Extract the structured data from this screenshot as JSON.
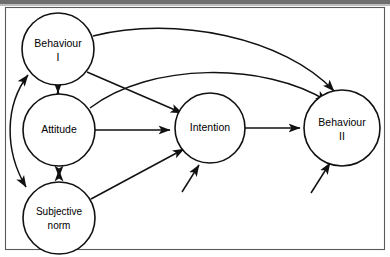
{
  "figure": {
    "kind": "path-diagram",
    "background_color": "#ffffff",
    "line_color": "#111111",
    "frame_color": "#5a5a5a",
    "top_bar_color": "#6e6e6e"
  },
  "nodes": [
    {
      "id": "behaviour1",
      "label_line1": "Behaviour",
      "label_line2": "I",
      "cx": 58,
      "cy": 49,
      "r": 36
    },
    {
      "id": "attitude",
      "label_line1": "Attitude",
      "label_line2": "",
      "cx": 59,
      "cy": 130,
      "r": 36
    },
    {
      "id": "subjective",
      "label_line1": "Subjective",
      "label_line2": "norm",
      "cx": 59,
      "cy": 218,
      "r": 36
    },
    {
      "id": "intention",
      "label_line1": "Intention",
      "label_line2": "",
      "cx": 210,
      "cy": 128,
      "r": 35
    },
    {
      "id": "behaviour2",
      "label_line1": "Behaviour",
      "label_line2": "II",
      "cx": 342,
      "cy": 128,
      "r": 38
    }
  ],
  "edges": [
    {
      "id": "behaviour1-to-behaviour2",
      "from": "behaviour1",
      "to": "behaviour2",
      "style": "curved",
      "arrow": "single"
    },
    {
      "id": "attitude-to-behaviour2",
      "from": "attitude",
      "to": "behaviour2",
      "style": "curved",
      "arrow": "single"
    },
    {
      "id": "behaviour1-to-intention",
      "from": "behaviour1",
      "to": "intention",
      "style": "straight",
      "arrow": "single"
    },
    {
      "id": "attitude-to-intention",
      "from": "attitude",
      "to": "intention",
      "style": "straight",
      "arrow": "single"
    },
    {
      "id": "subjective-to-intention",
      "from": "subjective",
      "to": "intention",
      "style": "straight",
      "arrow": "single"
    },
    {
      "id": "intention-to-behaviour2",
      "from": "intention",
      "to": "behaviour2",
      "style": "straight",
      "arrow": "single"
    },
    {
      "id": "behaviour1-attitude",
      "from": "behaviour1",
      "to": "attitude",
      "style": "straight",
      "arrow": "double"
    },
    {
      "id": "attitude-subjective",
      "from": "attitude",
      "to": "subjective",
      "style": "straight",
      "arrow": "double"
    },
    {
      "id": "behaviour1-subjective",
      "from": "behaviour1",
      "to": "subjective",
      "style": "curved",
      "arrow": "double"
    },
    {
      "id": "external-to-intention",
      "from": "external",
      "to": "intention",
      "style": "straight",
      "arrow": "single"
    },
    {
      "id": "external-to-behaviour2",
      "from": "external",
      "to": "behaviour2",
      "style": "straight",
      "arrow": "single"
    }
  ],
  "frame": {
    "left": 5,
    "top": 7,
    "width": 380,
    "height": 243,
    "visible_sides": [
      "top",
      "right",
      "bottom",
      "left"
    ]
  }
}
